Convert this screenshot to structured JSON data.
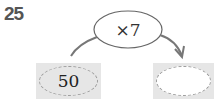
{
  "problem": {
    "number": "25",
    "operation": "×7",
    "input_value": "50",
    "output_value": ""
  },
  "colors": {
    "number_color": "#555555",
    "box_fill": "#e6e6e6",
    "dash_color": "#9a9a9a",
    "line_color": "#777777"
  }
}
